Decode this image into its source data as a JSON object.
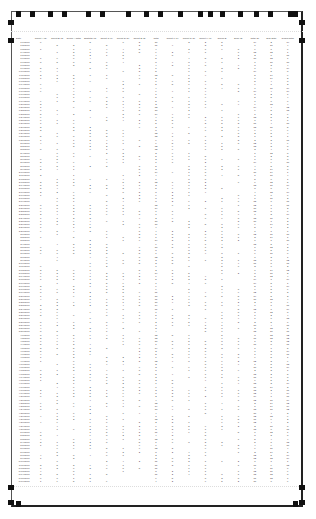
{
  "view": {
    "mode": "print-preview",
    "page": 1
  },
  "ruler": {
    "column_handles_x": [
      18,
      32,
      50,
      64,
      88,
      102,
      128,
      146,
      160,
      180,
      200,
      210,
      222,
      240,
      256,
      270,
      290,
      295
    ],
    "left_margin_handles_y": [
      20,
      38,
      485,
      500
    ],
    "right_margin_handles_y": [
      20,
      38,
      485,
      500
    ],
    "bottom_handles_x": [
      18,
      295
    ]
  },
  "table": {
    "headers": [
      "Date",
      "Count A (2)",
      "Count B (2)",
      "Group A Total",
      "Subtotal (3)",
      "Count C (1)",
      "Count D (3)",
      "Count E (2)",
      "Total",
      "Count F (1)",
      "Count G (3)",
      "Count H (1)",
      "Group B",
      "Sum (2)",
      "Total (2)",
      "Sub Total",
      "Grand Total"
    ],
    "rows": []
  }
}
